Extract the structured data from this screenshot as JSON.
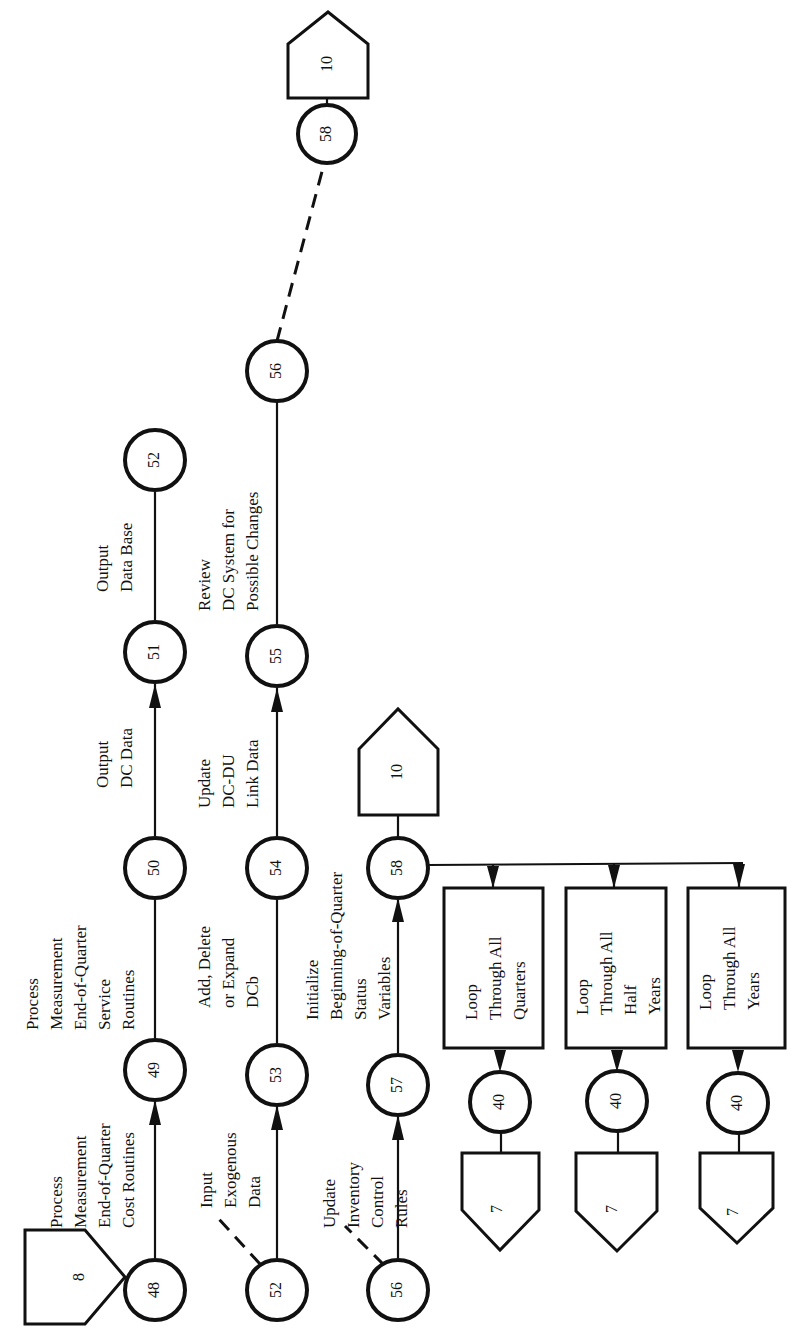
{
  "diagram": {
    "orientation": "rotated 90 degrees counter-clockwise",
    "connectors": {
      "entry_8": "8",
      "exit_10_top": "10",
      "exit_10_row3": "10",
      "loop_exit_1": "7",
      "loop_exit_2": "7",
      "loop_exit_3": "7"
    },
    "nodes": {
      "n48": "48",
      "n49": "49",
      "n50": "50",
      "n51": "51",
      "n52a": "52",
      "n52b": "52",
      "n53": "53",
      "n54": "54",
      "n55": "55",
      "n56a": "56",
      "n56b": "56",
      "n57": "57",
      "n58a": "58",
      "n58b": "58",
      "n40a": "40",
      "n40b": "40",
      "n40c": "40"
    },
    "activities": {
      "a48_49": [
        "Process",
        "Measurement",
        "End-of-Quarter",
        "Cost Routines"
      ],
      "a49_50": [
        "Process",
        "Measurement",
        "End-of-Quarter",
        "Service",
        "Routines"
      ],
      "a50_51": [
        "Output",
        "DC Data"
      ],
      "a51_52": [
        "Output",
        "Data Base"
      ],
      "a52_53": [
        "Input",
        "Exogenous",
        "Data"
      ],
      "a53_54": [
        "Add, Delete",
        "or Expand",
        "DCb"
      ],
      "a54_55": [
        "Update",
        "DC-DU",
        "Link Data"
      ],
      "a55_56": [
        "Review",
        "DC System for",
        "Possible Changes"
      ],
      "a56_57": [
        "Update",
        "Inventory",
        "Control",
        "Rules"
      ],
      "a57_58": [
        "Initialize",
        "Beginning-of-Quarter",
        "Status",
        "Variables"
      ]
    },
    "loops": {
      "quarters": [
        "Loop",
        "Through All",
        "Quarters"
      ],
      "half_years": [
        "Loop",
        "Through All",
        "Half",
        "Years"
      ],
      "years": [
        "Loop",
        "Through All",
        "Years"
      ]
    }
  }
}
